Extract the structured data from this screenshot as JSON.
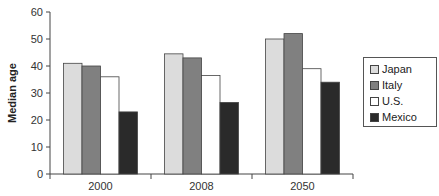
{
  "chart_data": {
    "type": "bar",
    "title": "",
    "xlabel": "",
    "ylabel": "Median age",
    "ylim": [
      0,
      60
    ],
    "yticks": [
      0,
      10,
      20,
      30,
      40,
      50,
      60
    ],
    "categories": [
      "2000",
      "2008",
      "2050"
    ],
    "series": [
      {
        "name": "Japan",
        "color": "#dcdcdc",
        "values": [
          41,
          44.5,
          50
        ]
      },
      {
        "name": "Italy",
        "color": "#808080",
        "values": [
          40,
          43,
          52
        ]
      },
      {
        "name": "U.S.",
        "color": "#ffffff",
        "values": [
          36,
          36.5,
          39
        ]
      },
      {
        "name": "Mexico",
        "color": "#2a2a2a",
        "values": [
          23,
          26.5,
          34
        ]
      }
    ],
    "grid": false,
    "legend_position": "right"
  },
  "legend": {
    "items": [
      {
        "label": "Japan"
      },
      {
        "label": "Italy"
      },
      {
        "label": "U.S."
      },
      {
        "label": "Mexico"
      }
    ]
  }
}
